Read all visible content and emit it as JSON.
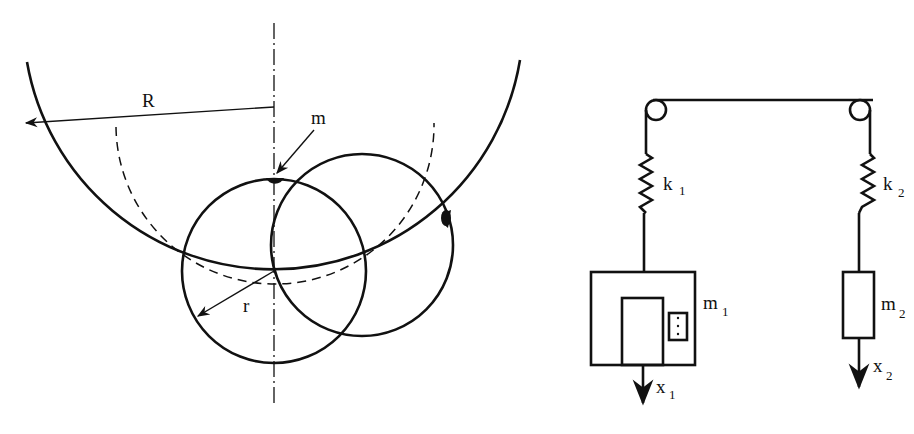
{
  "figure": {
    "left_diagram": {
      "description": "Small disk of radius r with point mass m rolling inside a circular bowl of radius R",
      "labels": {
        "big_radius": "R",
        "small_radius": "r",
        "mass": "m"
      }
    },
    "right_diagram": {
      "description": "Two masses hung from springs connected by a cable over two pulleys",
      "labels": {
        "spring1": {
          "main": "k",
          "sub": "1"
        },
        "spring2": {
          "main": "k",
          "sub": "2"
        },
        "mass1": {
          "main": "m",
          "sub": "1"
        },
        "mass2": {
          "main": "m",
          "sub": "2"
        },
        "disp1": {
          "main": "x",
          "sub": "1"
        },
        "disp2": {
          "main": "x",
          "sub": "2"
        }
      }
    }
  },
  "colors": {
    "ink": "#111111",
    "background": "#ffffff"
  }
}
